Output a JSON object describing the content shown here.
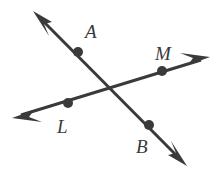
{
  "figure": {
    "background_color": "#ffffff",
    "stroke_color": "#3a3a3a",
    "dot_color": "#3a3a3a",
    "label_color": "#3a3a3a",
    "stroke_width": 3,
    "dot_radius": 5,
    "width": 223,
    "height": 170,
    "lines": [
      {
        "id": "line-ab",
        "name": "line-AB",
        "description": "Line through points A and B, double-headed arrow",
        "arrow_start": {
          "x": 33,
          "y": 11
        },
        "arrow_end": {
          "x": 187,
          "y": 166
        },
        "points": [
          "A",
          "B"
        ]
      },
      {
        "id": "line-lm",
        "name": "line-LM",
        "description": "Line through points L and M, double-headed arrow",
        "arrow_start": {
          "x": 12,
          "y": 118
        },
        "arrow_end": {
          "x": 210,
          "y": 57
        },
        "points": [
          "L",
          "M"
        ]
      }
    ],
    "intersection": {
      "x": 115,
      "y": 88
    },
    "points": [
      {
        "id": "point-a",
        "label": "A",
        "dot": {
          "x": 78,
          "y": 52
        },
        "label_pos": {
          "x": 85,
          "y": 38
        },
        "on_line": "line-AB"
      },
      {
        "id": "point-m",
        "label": "M",
        "dot": {
          "x": 162,
          "y": 71
        },
        "label_pos": {
          "x": 155,
          "y": 60
        },
        "on_line": "line-LM"
      },
      {
        "id": "point-l",
        "label": "L",
        "dot": {
          "x": 68,
          "y": 103
        },
        "label_pos": {
          "x": 57,
          "y": 133
        },
        "on_line": "line-LM"
      },
      {
        "id": "point-b",
        "label": "B",
        "dot": {
          "x": 149,
          "y": 125
        },
        "label_pos": {
          "x": 136,
          "y": 153
        },
        "on_line": "line-AB"
      }
    ]
  }
}
